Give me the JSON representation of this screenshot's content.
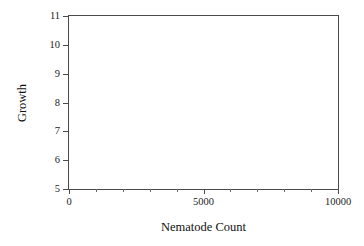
{
  "chart_data": {
    "type": "scatter",
    "title": "",
    "xlabel": "Nematode Count",
    "ylabel": "Growth",
    "xlim": [
      0,
      10000
    ],
    "ylim": [
      5,
      11
    ],
    "xticks": [
      0,
      5000,
      10000
    ],
    "xtick_labels": [
      "0",
      "5000",
      "10000"
    ],
    "x_minor_tick_interval": 1000,
    "yticks": [
      5,
      6,
      7,
      8,
      9,
      10,
      11
    ],
    "ytick_labels": [
      "5",
      "6",
      "7",
      "8",
      "9",
      "10",
      "11"
    ],
    "grid": false,
    "legend": null,
    "series": [
      {
        "name": "",
        "x": [],
        "y": []
      }
    ],
    "annotations": [],
    "frame": "box",
    "note": "Empty plot axes - no data points are plotted"
  },
  "style": {
    "background": "#ffffff",
    "axis_color": "#4a4a4a",
    "tick_color": "#4a4a4a",
    "text_color": "#111111"
  }
}
